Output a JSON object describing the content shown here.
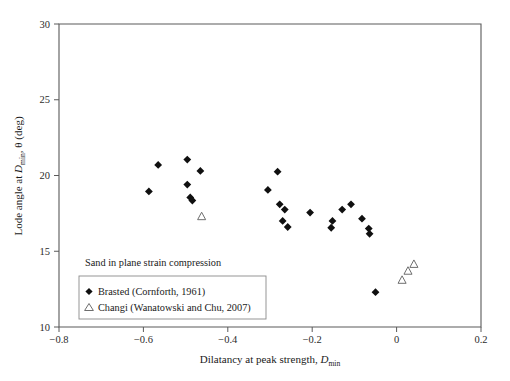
{
  "chart_data": {
    "type": "scatter",
    "title": "",
    "xlabel": "Dilatancy at peak strength, D_min",
    "xlabel_main": "Dilatancy at peak strength, ",
    "xlabel_symbol": "D",
    "xlabel_subscript": "min",
    "ylabel": "Lode angle at D_min, θ (deg)",
    "ylabel_part1": "Lode angle at ",
    "ylabel_symbol": "D",
    "ylabel_subscript": "min",
    "ylabel_part2": ", θ (deg)",
    "xlim": [
      -0.8,
      0.2
    ],
    "ylim": [
      10,
      30
    ],
    "xticks": [
      -0.8,
      -0.6,
      -0.4,
      -0.2,
      0,
      0.2
    ],
    "xtick_labels": [
      "−0.8",
      "−0.6",
      "−0.4",
      "−0.2",
      "0",
      "0.2"
    ],
    "yticks": [
      10,
      15,
      20,
      25,
      30
    ],
    "ytick_labels": [
      "10",
      "15",
      "20",
      "25",
      "30"
    ],
    "grid": false,
    "legend_position": "lower-left-inside",
    "annotation": "Sand in plane strain compression",
    "series": [
      {
        "name": "Brasted (Cornforth, 1961)",
        "marker": "filled-diamond",
        "color": "#101010",
        "points": [
          [
            -0.565,
            20.7
          ],
          [
            -0.496,
            21.05
          ],
          [
            -0.587,
            18.95
          ],
          [
            -0.465,
            20.3
          ],
          [
            -0.496,
            19.4
          ],
          [
            -0.489,
            18.55
          ],
          [
            -0.484,
            18.35
          ],
          [
            -0.282,
            20.25
          ],
          [
            -0.305,
            19.05
          ],
          [
            -0.277,
            18.1
          ],
          [
            -0.265,
            17.75
          ],
          [
            -0.27,
            17.0
          ],
          [
            -0.258,
            16.6
          ],
          [
            -0.205,
            17.55
          ],
          [
            -0.129,
            17.75
          ],
          [
            -0.108,
            18.1
          ],
          [
            -0.152,
            17.0
          ],
          [
            -0.155,
            16.55
          ],
          [
            -0.082,
            17.15
          ],
          [
            -0.066,
            16.5
          ],
          [
            -0.064,
            16.15
          ],
          [
            -0.05,
            12.3
          ]
        ]
      },
      {
        "name": "Changi (Wanatowski and Chu, 2007)",
        "marker": "open-triangle",
        "color": "#6e6e6e",
        "points": [
          [
            -0.462,
            17.3
          ],
          [
            0.013,
            13.1
          ],
          [
            0.027,
            13.7
          ],
          [
            0.041,
            14.15
          ]
        ]
      }
    ]
  },
  "legend": {
    "annotation": "Sand in plane strain compression",
    "entries": [
      {
        "label": "Brasted (Cornforth, 1961)",
        "marker": "filled-diamond"
      },
      {
        "label": "Changi (Wanatowski and Chu, 2007)",
        "marker": "open-triangle"
      }
    ]
  }
}
